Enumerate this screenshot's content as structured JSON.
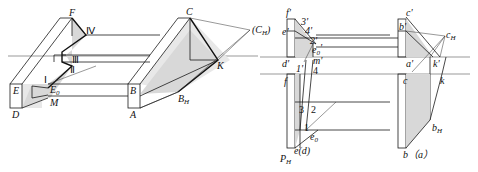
{
  "figure": {
    "left_view": {
      "description": "axonometric view of frame with hip roof edges",
      "labels": {
        "F": "F",
        "IV": "Ⅳ",
        "III": "Ⅲ",
        "II": "Ⅱ",
        "I": "Ⅰ",
        "E": "E",
        "E0": "E",
        "E0_sub": "0",
        "M": "M",
        "D": "D",
        "B": "B",
        "A": "A",
        "C": "C",
        "CH": "(C",
        "CH_sub": "H",
        "CH_close": ")",
        "K": "K",
        "BH": "B",
        "BH_sub": "H"
      }
    },
    "right_view": {
      "description": "orthographic projection (V and H views)",
      "labels": {
        "f_prime": "f'",
        "three_prime": "3'",
        "four_prime": "4'",
        "two_prime": "2'",
        "e_prime": "e'",
        "e0_prime": "e",
        "e0_prime_sub": "0",
        "e0_prime_mark": "'",
        "d_prime": "d'",
        "one_prime": "1'",
        "m_prime": "m'",
        "four": "4",
        "f": "f",
        "three": "3",
        "two": "2",
        "one": "1",
        "e0": "e",
        "e0_sub": "0",
        "e_d": "e(d)",
        "PH": "P",
        "PH_sub": "H",
        "c_prime": "c'",
        "b_prime": "b'",
        "cH": "c",
        "cH_sub": "H",
        "a_prime": "a'",
        "k_prime": "k'",
        "c": "c",
        "k": "k",
        "bH": "b",
        "bH_sub": "H",
        "b_a": "b（a）"
      }
    }
  }
}
